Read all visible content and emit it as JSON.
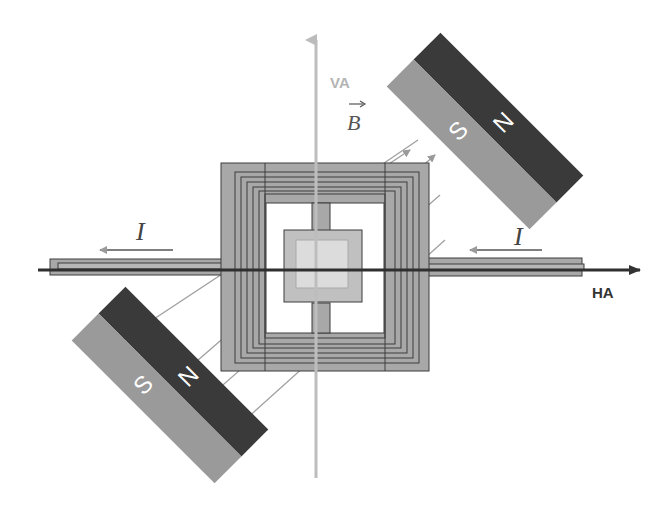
{
  "diagram": {
    "axes": {
      "vertical_label": "VA",
      "horizontal_label": "HA"
    },
    "field_label": "B",
    "current_labels": {
      "left": "I",
      "right": "I"
    },
    "magnets": [
      {
        "position": "top-right",
        "north_label": "N",
        "south_label": "S"
      },
      {
        "position": "bottom-left",
        "north_label": "N",
        "south_label": "S"
      }
    ],
    "colors": {
      "magnet_north": "#3a3a3a",
      "magnet_south": "#9a9a9a",
      "coil_fill": "#a8a8a8",
      "coil_stroke": "#3c3c3c",
      "center_plate": "#c8c8c8",
      "center_inner": "#dadada",
      "vertical_axis": "#b8b8b8",
      "horizontal_axis": "#2f2f2f",
      "field_lines": "#9a9a9a",
      "background": "#ffffff"
    }
  }
}
